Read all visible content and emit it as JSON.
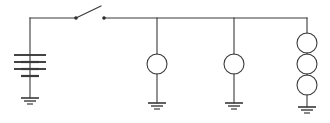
{
  "diagram": {
    "type": "circuit-schematic",
    "background_color": "#ffffff",
    "line_color": "#3a3a3a",
    "canvas": {
      "width": 330,
      "height": 123
    },
    "bus": {
      "name": "top-supply-rail",
      "y": 18,
      "x_start": 30,
      "x_end": 307
    },
    "source": {
      "name": "battery",
      "symbol": "multi-cell-battery",
      "x": 30,
      "top_y": 18,
      "bottom_y": 108,
      "cells": 4,
      "plate_long_half_width": 16,
      "plate_short_half_width": 9,
      "plate_top_y": 55,
      "plate_spacing": 7,
      "ground": {
        "name": "battery-ground",
        "y": 98
      }
    },
    "switch": {
      "name": "knife-switch",
      "state": "open",
      "pivot_x": 76,
      "contact_x": 104,
      "y": 18,
      "blade_tip_x": 101,
      "blade_tip_y": 6
    },
    "branches": [
      {
        "name": "branch-lamp-1",
        "x": 157,
        "devices": 1,
        "device_symbol": "circle",
        "device_radius": 10,
        "device_center_y": 64,
        "ground_y": 103
      },
      {
        "name": "branch-lamp-2",
        "x": 234,
        "devices": 1,
        "device_symbol": "circle",
        "device_radius": 10,
        "device_center_y": 64,
        "ground_y": 103
      },
      {
        "name": "branch-lamp-stack-3",
        "x": 307,
        "devices": 3,
        "device_symbol": "circle",
        "device_radius": 10,
        "device_centers_y": [
          43,
          64,
          85
        ],
        "ground_y": 107
      }
    ],
    "ground_symbol": {
      "name": "earth-ground",
      "bars": [
        {
          "half_width": 9,
          "offset": 0
        },
        {
          "half_width": 6,
          "offset": 3
        },
        {
          "half_width": 3,
          "offset": 6
        }
      ]
    }
  }
}
